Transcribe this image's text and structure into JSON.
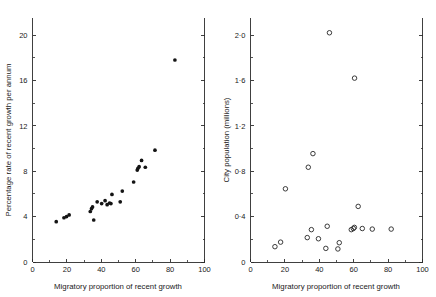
{
  "figure": {
    "panels": [
      "left",
      "right"
    ],
    "background": "#ffffff",
    "marker_color": "#141414"
  },
  "chart_data": [
    {
      "type": "scatter",
      "title": "",
      "panel": "left",
      "xlabel": "Migratory proportion of recent growth",
      "ylabel": "Percentage rate of recent growth per annum",
      "xlim": [
        0,
        100
      ],
      "ylim": [
        0,
        21.5
      ],
      "grid": false,
      "legend": "none",
      "marker": "filled-circle",
      "xticks": [
        0,
        20,
        40,
        60,
        80,
        100
      ],
      "xticklabels": [
        "0",
        "20",
        "40",
        "60",
        "80",
        "100"
      ],
      "xminorticks": [
        10,
        30,
        50,
        70,
        90
      ],
      "yticks": [
        0,
        4,
        8,
        12,
        16,
        20
      ],
      "yticklabels": [
        "0",
        "4",
        "8",
        "12",
        "16",
        "20"
      ],
      "yminorticks": [
        2,
        6,
        10,
        14,
        18
      ],
      "points": [
        {
          "x": 13.8,
          "y": 3.55
        },
        {
          "x": 18.3,
          "y": 3.9
        },
        {
          "x": 19.8,
          "y": 4.0
        },
        {
          "x": 21.3,
          "y": 4.15
        },
        {
          "x": 33.6,
          "y": 4.45
        },
        {
          "x": 34.3,
          "y": 4.7
        },
        {
          "x": 34.9,
          "y": 4.85
        },
        {
          "x": 35.6,
          "y": 3.7
        },
        {
          "x": 37.6,
          "y": 5.3
        },
        {
          "x": 40.2,
          "y": 5.15
        },
        {
          "x": 42.2,
          "y": 5.4
        },
        {
          "x": 43.4,
          "y": 5.05
        },
        {
          "x": 44.8,
          "y": 5.2
        },
        {
          "x": 45.6,
          "y": 5.15
        },
        {
          "x": 46.2,
          "y": 5.95
        },
        {
          "x": 51.0,
          "y": 5.3
        },
        {
          "x": 52.2,
          "y": 6.25
        },
        {
          "x": 58.8,
          "y": 7.05
        },
        {
          "x": 60.9,
          "y": 8.1
        },
        {
          "x": 61.3,
          "y": 8.25
        },
        {
          "x": 62.0,
          "y": 8.4
        },
        {
          "x": 63.4,
          "y": 8.95
        },
        {
          "x": 65.6,
          "y": 8.35
        },
        {
          "x": 71.2,
          "y": 9.85
        },
        {
          "x": 82.8,
          "y": 17.8
        }
      ]
    },
    {
      "type": "scatter",
      "title": "",
      "panel": "right",
      "xlabel": "Migratory proportion of recent growth",
      "ylabel": "City population (millions)",
      "xlim": [
        0,
        100
      ],
      "ylim": [
        0,
        2.15
      ],
      "grid": false,
      "legend": "none",
      "marker": "open-circle",
      "xticks": [
        0,
        20,
        40,
        60,
        80,
        100
      ],
      "xticklabels": [
        "0",
        "20",
        "40",
        "60",
        "80",
        "100"
      ],
      "xminorticks": [
        10,
        30,
        50,
        70,
        90
      ],
      "yticks": [
        0,
        0.4,
        0.8,
        1.2,
        1.6,
        2.0
      ],
      "yticklabels": [
        "0",
        "0·4",
        "0·8",
        "1·2",
        "1·6",
        "2·0"
      ],
      "yminorticks": [
        0.2,
        0.6,
        1.0,
        1.4,
        1.8
      ],
      "points": [
        {
          "x": 14.2,
          "y": 0.135
        },
        {
          "x": 17.5,
          "y": 0.175
        },
        {
          "x": 20.3,
          "y": 0.645
        },
        {
          "x": 33.0,
          "y": 0.215
        },
        {
          "x": 33.6,
          "y": 0.835
        },
        {
          "x": 35.4,
          "y": 0.285
        },
        {
          "x": 36.3,
          "y": 0.955
        },
        {
          "x": 39.5,
          "y": 0.205
        },
        {
          "x": 43.8,
          "y": 0.12
        },
        {
          "x": 44.6,
          "y": 0.315
        },
        {
          "x": 45.9,
          "y": 2.02
        },
        {
          "x": 50.8,
          "y": 0.115
        },
        {
          "x": 51.6,
          "y": 0.17
        },
        {
          "x": 58.6,
          "y": 0.285
        },
        {
          "x": 59.8,
          "y": 0.295
        },
        {
          "x": 60.4,
          "y": 0.305
        },
        {
          "x": 60.5,
          "y": 1.62
        },
        {
          "x": 62.6,
          "y": 0.49
        },
        {
          "x": 65.0,
          "y": 0.295
        },
        {
          "x": 70.8,
          "y": 0.29
        },
        {
          "x": 81.8,
          "y": 0.29
        }
      ]
    }
  ]
}
